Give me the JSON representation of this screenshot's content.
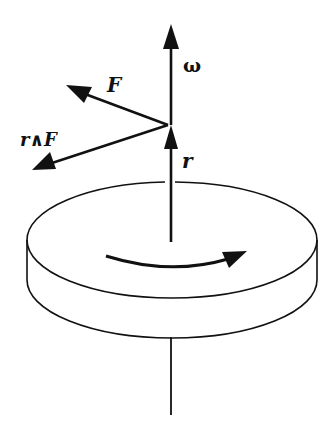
{
  "diagram": {
    "labels": {
      "omega": "ω",
      "force": "F",
      "torque": "r∧F",
      "radius": "r"
    },
    "colors": {
      "stroke": "#111111",
      "background": "#ffffff"
    },
    "elements": [
      {
        "id": "omega-vector",
        "type": "arrow",
        "from": [
          171,
          125
        ],
        "to": [
          171,
          24
        ],
        "label": "ω"
      },
      {
        "id": "force-vector",
        "type": "arrow",
        "from": [
          168,
          125
        ],
        "to": [
          66,
          85
        ],
        "label": "F"
      },
      {
        "id": "torque-vector",
        "type": "arrow",
        "from": [
          168,
          125
        ],
        "to": [
          32,
          170
        ],
        "label": "r∧F"
      },
      {
        "id": "radius-vector",
        "type": "arrow",
        "from": [
          171,
          242
        ],
        "to": [
          171,
          125
        ],
        "label": "r"
      },
      {
        "id": "disk",
        "type": "cylinder",
        "center": [
          171,
          240
        ],
        "rx": 145,
        "ry": 58,
        "thickness": 40
      },
      {
        "id": "rotation-arrow",
        "type": "curved-arrow",
        "direction": "clockwise-front"
      },
      {
        "id": "axle",
        "type": "line",
        "from": [
          171,
          337
        ],
        "to": [
          171,
          415
        ]
      }
    ]
  }
}
